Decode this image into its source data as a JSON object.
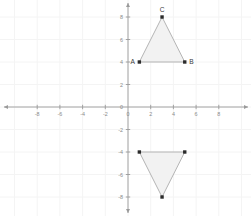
{
  "figure": {
    "type": "coordinate-plane",
    "background_color": "#ffffff",
    "grid_color": "#f4f4f4",
    "axis_color": "#9a9a9a",
    "tick_label_color": "#8a8a8a",
    "triangle_fill": "#f2f2f2",
    "triangle_stroke": "#a8a8a8",
    "vertex_color": "#2b2b2b",
    "vertex_label_color": "#3a3a3a"
  },
  "chart_data": {
    "type": "scatter",
    "title": "",
    "xlabel": "",
    "ylabel": "",
    "xlim": [
      -9.5,
      10.5
    ],
    "ylim": [
      -9.5,
      9.5
    ],
    "grid": true,
    "legend": "none",
    "x_ticks": [
      -8,
      -6,
      -4,
      -2,
      0,
      2,
      4,
      6,
      8
    ],
    "y_ticks": [
      8,
      6,
      4,
      2,
      0,
      -2,
      -4,
      -6,
      -8
    ],
    "x_tick_labels": [
      "-8",
      "-6",
      "-4",
      "-2",
      "0",
      "2",
      "4",
      "6",
      "8"
    ],
    "y_tick_labels": [
      "8",
      "6",
      "4",
      "2",
      "0",
      "-2",
      "-4",
      "-6",
      "-8"
    ],
    "origin_label": "0",
    "series": [
      {
        "name": "Triangle ABC",
        "shape": "triangle",
        "points": [
          {
            "label": "A",
            "x": 1,
            "y": 4,
            "label_position": "left"
          },
          {
            "label": "B",
            "x": 5,
            "y": 4,
            "label_position": "right"
          },
          {
            "label": "C",
            "x": 3,
            "y": 8,
            "label_position": "above"
          }
        ]
      },
      {
        "name": "Reflected Triangle",
        "shape": "triangle",
        "points": [
          {
            "label": "",
            "x": 1,
            "y": -4,
            "label_position": ""
          },
          {
            "label": "",
            "x": 5,
            "y": -4,
            "label_position": ""
          },
          {
            "label": "",
            "x": 3,
            "y": -8,
            "label_position": ""
          }
        ]
      }
    ]
  }
}
